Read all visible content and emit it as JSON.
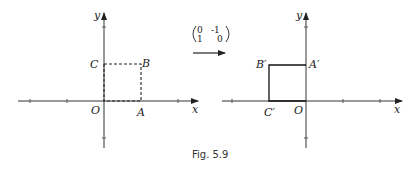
{
  "figure": {
    "caption": "Fig. 5.9",
    "left_panel": {
      "axis_x_label": "x",
      "axis_y_label": "y",
      "origin_label": "O",
      "points": [
        {
          "name": "O",
          "label": "O",
          "coords": [
            0,
            0
          ]
        },
        {
          "name": "A",
          "label": "A",
          "coords": [
            1,
            0
          ]
        },
        {
          "name": "B",
          "label": "B",
          "coords": [
            1,
            1
          ]
        },
        {
          "name": "C",
          "label": "C",
          "coords": [
            0,
            1
          ]
        }
      ],
      "square_style": "dashed"
    },
    "transformation": {
      "matrix": [
        [
          "0",
          "-1"
        ],
        [
          "1",
          "0"
        ]
      ],
      "arrow": "right-arrow"
    },
    "right_panel": {
      "axis_x_label": "x",
      "axis_y_label": "y",
      "origin_label": "O",
      "points": [
        {
          "name": "O",
          "label": "O",
          "coords": [
            0,
            0
          ]
        },
        {
          "name": "A'",
          "label": "A′",
          "coords": [
            0,
            1
          ]
        },
        {
          "name": "B'",
          "label": "B′",
          "coords": [
            -1,
            1
          ]
        },
        {
          "name": "C'",
          "label": "C′",
          "coords": [
            -1,
            0
          ]
        }
      ],
      "square_style": "solid"
    }
  }
}
